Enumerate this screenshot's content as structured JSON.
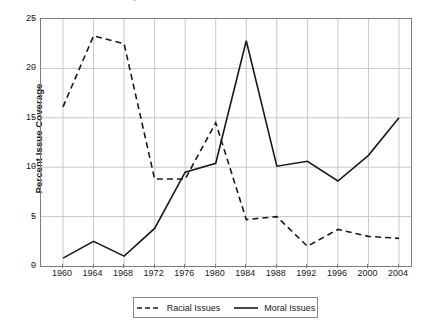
{
  "figure": {
    "title_remnant": "Issue Coverage",
    "background": "#ffffff"
  },
  "chart_data": {
    "type": "line",
    "title": "",
    "xlabel": "",
    "ylabel": "Percent Issue Coverage",
    "x": [
      1960,
      1964,
      1968,
      1972,
      1976,
      1980,
      1984,
      1988,
      1992,
      1996,
      2000,
      2004
    ],
    "categories": [
      "1960",
      "1964",
      "1968",
      "1972",
      "1976",
      "1980",
      "1984",
      "1988",
      "1992",
      "1996",
      "2000",
      "2004"
    ],
    "xlim": [
      1960,
      2004
    ],
    "ylim": [
      0,
      25
    ],
    "yticks": [
      0,
      5,
      10,
      15,
      20,
      25
    ],
    "ytick_labels": [
      "0",
      "5",
      "10",
      "15",
      "20",
      "25"
    ],
    "grid": true,
    "grid_color": "#c8c8c8",
    "legend_position": "below-center",
    "series": [
      {
        "name": "Racial Issues",
        "style": "dashed",
        "color": "#1a1a1a",
        "values": [
          16.1,
          23.3,
          22.5,
          8.8,
          8.8,
          14.5,
          4.7,
          5.0,
          2.0,
          3.7,
          3.0,
          2.8
        ]
      },
      {
        "name": "Moral Issues",
        "style": "solid",
        "color": "#1a1a1a",
        "values": [
          0.8,
          2.5,
          1.0,
          3.8,
          9.5,
          10.4,
          22.8,
          10.1,
          10.6,
          8.6,
          11.2,
          15.0
        ]
      }
    ]
  },
  "legend": {
    "entries": [
      {
        "label": "Racial Issues",
        "style": "dashed"
      },
      {
        "label": "Moral Issues",
        "style": "solid"
      }
    ]
  }
}
